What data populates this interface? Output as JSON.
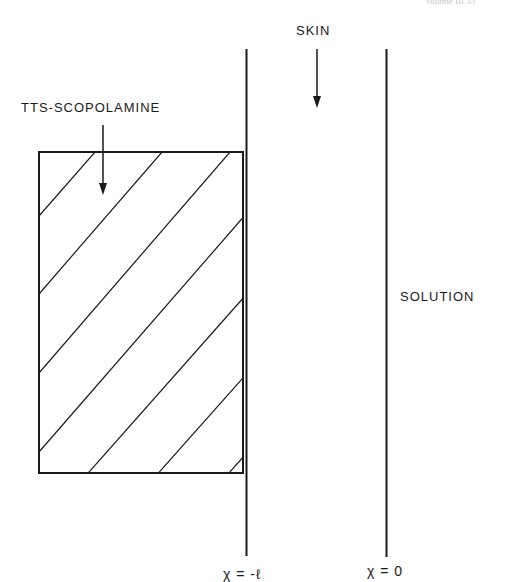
{
  "header": {
    "text": "Volume III     35"
  },
  "labels": {
    "skin": "SKIN",
    "patch": "TTS-SCOPOLAMINE",
    "solution": "SOLUTION",
    "x_left": "χ = -ℓ",
    "x_right": "χ = 0"
  },
  "colors": {
    "line": "#1a1a1a",
    "background": "#ffffff"
  }
}
